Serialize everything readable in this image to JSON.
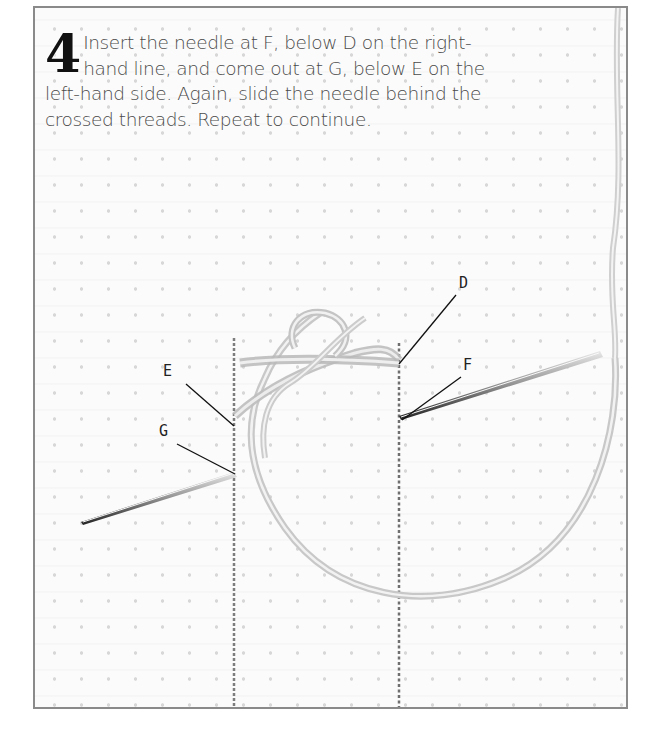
{
  "step": {
    "number": "4",
    "text": "Insert the needle at F, below D on the right-hand line, and come out at G, below E on the left-hand side. Again, slide the needle behind the crossed threads. Repeat to continue."
  },
  "labels": {
    "D": "D",
    "E": "E",
    "F": "F",
    "G": "G"
  },
  "illustration": {
    "subject": "needle and thread stitching on even-weave fabric between two vertical guide lines",
    "thread_color": "#d9d9d9",
    "needle_color": "#555555",
    "guide_line_color": "#7a7a7a",
    "frame_border_color": "#8a8a8a"
  }
}
